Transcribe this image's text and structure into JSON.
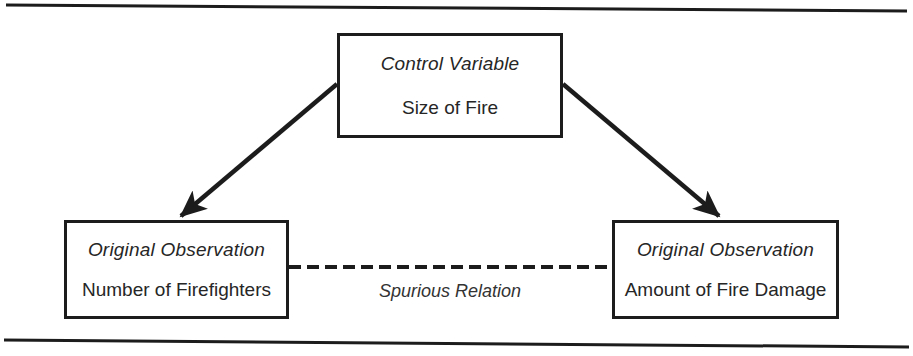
{
  "figure": {
    "title_rule_top": "horizontal-rule",
    "title_rule_bottom": "horizontal-rule",
    "background_color": "#ffffff",
    "line_color": "#1c1c1c",
    "text_color": "#262626"
  },
  "nodes": {
    "control": {
      "role": "Control Variable",
      "name": "Size of Fire"
    },
    "left": {
      "role": "Original Observation",
      "name": "Number of Firefighters"
    },
    "right": {
      "role": "Original Observation",
      "name": "Amount of Fire Damage"
    }
  },
  "edges": {
    "control_to_left": {
      "style": "solid-arrow",
      "label": ""
    },
    "control_to_right": {
      "style": "solid-arrow",
      "label": ""
    },
    "left_to_right": {
      "style": "dashed",
      "label": "Spurious Relation"
    }
  }
}
